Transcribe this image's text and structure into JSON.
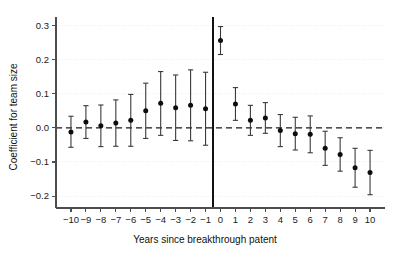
{
  "chart_data": {
    "type": "scatter",
    "title": "",
    "xlabel": "Years since breakthrough patent",
    "ylabel": "Coefficient for team size",
    "xlim": [
      -11,
      11
    ],
    "ylim": [
      -0.235,
      0.325
    ],
    "grid": true,
    "legend": null,
    "yticks": [
      0.3,
      0.2,
      0.1,
      0.0,
      -0.1,
      -0.2
    ],
    "ytick_labels": [
      "0.3",
      "0.2",
      "0.1",
      "0.0",
      "−0.1",
      "−0.2"
    ],
    "xticks": [
      -10,
      -9,
      -8,
      -7,
      -6,
      -5,
      -4,
      -3,
      -2,
      -1,
      0,
      1,
      2,
      3,
      4,
      5,
      6,
      7,
      8,
      9,
      10
    ],
    "xtick_labels": [
      "−10",
      "−9",
      "−8",
      "−7",
      "−6",
      "−5",
      "−4",
      "−3",
      "−2",
      "−1",
      "0",
      "1",
      "2",
      "3",
      "4",
      "5",
      "6",
      "7",
      "8",
      "9",
      "10"
    ],
    "annotations": {
      "zero_reference_line": 0.0,
      "event_vertical_line_x": -0.5
    },
    "marker_color": "#0d0d0d",
    "errorbar_color": "#3a3a3a",
    "x": [
      -10,
      -9,
      -8,
      -7,
      -6,
      -5,
      -4,
      -3,
      -2,
      -1,
      0,
      1,
      2,
      3,
      4,
      5,
      6,
      7,
      8,
      9,
      10
    ],
    "values": [
      -0.012,
      0.017,
      0.006,
      0.014,
      0.022,
      0.05,
      0.072,
      0.059,
      0.066,
      0.056,
      0.256,
      0.07,
      0.022,
      0.029,
      -0.008,
      -0.017,
      -0.019,
      -0.06,
      -0.078,
      -0.117,
      -0.131
    ],
    "ci_low": [
      -0.057,
      -0.031,
      -0.055,
      -0.054,
      -0.054,
      -0.031,
      -0.022,
      -0.037,
      -0.038,
      -0.051,
      0.215,
      0.022,
      -0.022,
      -0.016,
      -0.055,
      -0.065,
      -0.073,
      -0.11,
      -0.127,
      -0.174,
      -0.196
    ],
    "ci_high": [
      0.034,
      0.065,
      0.067,
      0.082,
      0.098,
      0.131,
      0.165,
      0.155,
      0.17,
      0.163,
      0.297,
      0.118,
      0.066,
      0.074,
      0.039,
      0.031,
      0.035,
      -0.01,
      -0.029,
      -0.06,
      -0.066
    ]
  }
}
